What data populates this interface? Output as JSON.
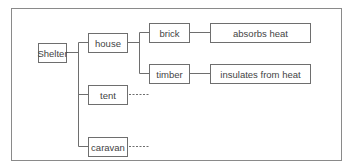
{
  "diagram": {
    "type": "tree",
    "root": {
      "id": "shelter",
      "label": "Shelter"
    },
    "nodes": [
      {
        "id": "shelter",
        "label": "Shelter"
      },
      {
        "id": "house",
        "label": "house"
      },
      {
        "id": "tent",
        "label": "tent"
      },
      {
        "id": "caravan",
        "label": "caravan"
      },
      {
        "id": "brick",
        "label": "brick"
      },
      {
        "id": "timber",
        "label": "timber"
      },
      {
        "id": "absorbs",
        "label": "absorbs heat"
      },
      {
        "id": "insulates",
        "label": "insulates from heat"
      }
    ],
    "edges": [
      {
        "from": "shelter",
        "to": "house",
        "style": "solid"
      },
      {
        "from": "shelter",
        "to": "tent",
        "style": "solid"
      },
      {
        "from": "shelter",
        "to": "caravan",
        "style": "solid"
      },
      {
        "from": "house",
        "to": "brick",
        "style": "solid"
      },
      {
        "from": "house",
        "to": "timber",
        "style": "solid"
      },
      {
        "from": "brick",
        "to": "absorbs",
        "style": "solid"
      },
      {
        "from": "timber",
        "to": "insulates",
        "style": "solid"
      },
      {
        "from": "tent",
        "to": null,
        "style": "dotted"
      },
      {
        "from": "caravan",
        "to": null,
        "style": "dotted"
      }
    ]
  },
  "labels": {
    "shelter": "Shelter",
    "house": "house",
    "tent": "tent",
    "caravan": "caravan",
    "brick": "brick",
    "timber": "timber",
    "absorbs": "absorbs heat",
    "insulates": "insulates from heat"
  },
  "colors": {
    "line": "#6e6e6e",
    "frame": "#8a8a8a",
    "text": "#444444"
  }
}
